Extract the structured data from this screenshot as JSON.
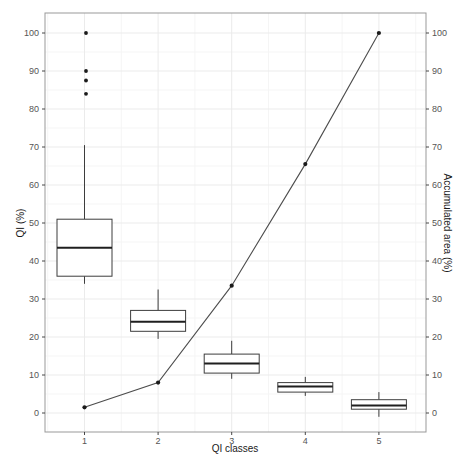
{
  "chart_data": {
    "type": "boxplot+line",
    "title": "",
    "xlabel": "QI classes",
    "ylabel_left": "QI (%)",
    "ylabel_right": "Accumulated area (%)",
    "categories": [
      "1",
      "2",
      "3",
      "4",
      "5"
    ],
    "y_ticks": [
      0,
      10,
      20,
      30,
      40,
      50,
      60,
      70,
      80,
      90,
      100
    ],
    "ylim": [
      -5,
      105
    ],
    "grid": "major and minor, light gray, on white panel",
    "legend": "none",
    "boxes": [
      {
        "class": "1",
        "whisker_low": 34,
        "q1": 36,
        "median": 43.5,
        "q3": 51,
        "whisker_high": 70.5,
        "outliers": [
          84,
          87.5,
          90,
          100
        ]
      },
      {
        "class": "2",
        "whisker_low": 19.5,
        "q1": 21.5,
        "median": 24,
        "q3": 27,
        "whisker_high": 32.5,
        "outliers": []
      },
      {
        "class": "3",
        "whisker_low": 9,
        "q1": 10.5,
        "median": 13,
        "q3": 15.5,
        "whisker_high": 19,
        "outliers": []
      },
      {
        "class": "4",
        "whisker_low": 4.5,
        "q1": 5.5,
        "median": 7,
        "q3": 8,
        "whisker_high": 9.5,
        "outliers": []
      },
      {
        "class": "5",
        "whisker_low": -1,
        "q1": 1,
        "median": 2,
        "q3": 3.5,
        "whisker_high": 5.5,
        "outliers": []
      }
    ],
    "series": [
      {
        "name": "Accumulated area (%)",
        "type": "line",
        "values": [
          1.5,
          8,
          33.5,
          65.5,
          100
        ]
      }
    ],
    "colors": {
      "background": "#ffffff",
      "panel_border": "#999999",
      "grid_major": "#ebebeb",
      "grid_minor": "#f5f5f5",
      "box_stroke": "#3d3d3d",
      "box_fill": "#ffffff",
      "median": "#1f1f1f",
      "line": "#4d4d4d",
      "point": "#1a1a1a",
      "tick_mark": "#333333",
      "tick_label": "#555555",
      "axis_title": "#1a1a1a"
    }
  }
}
